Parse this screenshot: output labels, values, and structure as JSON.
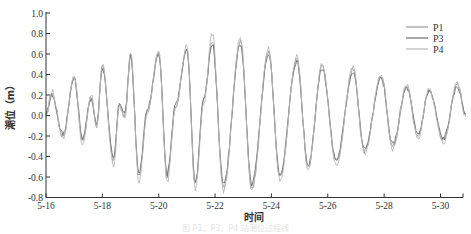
{
  "chart_data": {
    "type": "line",
    "title": "",
    "xlabel": "时间",
    "ylabel": "潮位（m）",
    "ylim": [
      -0.8,
      1.0
    ],
    "xlim": [
      16,
      30.9
    ],
    "yticks": [
      -0.8,
      -0.6,
      -0.4,
      -0.2,
      0.0,
      0.2,
      0.4,
      0.6,
      0.8,
      1.0
    ],
    "ytick_labels": [
      "-0.8",
      "-0.6",
      "-0.4",
      "-0.2",
      "0.0",
      "0.2",
      "0.4",
      "0.6",
      "0.8",
      "1.0"
    ],
    "xticks": [
      16,
      18,
      20,
      22,
      24,
      26,
      28,
      30
    ],
    "xtick_labels": [
      "5-16",
      "5-18",
      "5-20",
      "5-22",
      "5-24",
      "5-26",
      "5-28",
      "5-30"
    ],
    "grid": false,
    "legend_position": "upper right",
    "x": [
      16.0,
      16.2,
      16.6,
      17.0,
      17.3,
      17.6,
      17.8,
      18.0,
      18.4,
      18.6,
      18.8,
      19.0,
      19.3,
      19.6,
      20.0,
      20.3,
      20.6,
      21.0,
      21.3,
      21.6,
      21.9,
      22.3,
      22.9,
      23.3,
      23.9,
      24.3,
      24.9,
      25.3,
      25.8,
      26.3,
      26.9,
      27.3,
      27.9,
      28.3,
      28.8,
      29.2,
      29.6,
      30.1,
      30.6,
      30.9
    ],
    "series": [
      {
        "name": "P1",
        "color": "#9a9a9a",
        "values": [
          0.0,
          0.22,
          -0.2,
          0.37,
          -0.25,
          0.18,
          -0.1,
          0.48,
          -0.45,
          0.1,
          0.0,
          0.6,
          -0.6,
          0.05,
          0.62,
          -0.6,
          0.1,
          0.65,
          -0.68,
          0.15,
          0.72,
          -0.7,
          0.72,
          -0.7,
          0.62,
          -0.6,
          0.55,
          -0.5,
          0.48,
          -0.45,
          0.45,
          -0.35,
          0.38,
          -0.3,
          0.28,
          -0.2,
          0.25,
          -0.25,
          0.3,
          0.0
        ]
      },
      {
        "name": "P3",
        "color": "#6e6e6e",
        "values": [
          0.02,
          0.2,
          -0.18,
          0.36,
          -0.22,
          0.17,
          -0.08,
          0.46,
          -0.42,
          0.11,
          0.02,
          0.58,
          -0.57,
          0.07,
          0.6,
          -0.57,
          0.12,
          0.63,
          -0.65,
          0.17,
          0.7,
          -0.67,
          0.7,
          -0.67,
          0.6,
          -0.57,
          0.53,
          -0.48,
          0.46,
          -0.43,
          0.43,
          -0.33,
          0.36,
          -0.28,
          0.27,
          -0.18,
          0.24,
          -0.22,
          0.28,
          0.02
        ]
      },
      {
        "name": "P4",
        "color": "#b8b8b8",
        "values": [
          -0.02,
          0.24,
          -0.22,
          0.39,
          -0.3,
          0.2,
          -0.12,
          0.5,
          -0.5,
          0.09,
          -0.02,
          0.63,
          -0.65,
          0.03,
          0.64,
          -0.65,
          0.08,
          0.68,
          -0.72,
          0.13,
          0.8,
          -0.74,
          0.76,
          -0.74,
          0.65,
          -0.64,
          0.58,
          -0.53,
          0.5,
          -0.48,
          0.47,
          -0.38,
          0.4,
          -0.33,
          0.3,
          -0.23,
          0.26,
          -0.28,
          0.32,
          -0.02
        ]
      }
    ]
  },
  "caption": "图  P1、P3、P4 站潮位过程线"
}
